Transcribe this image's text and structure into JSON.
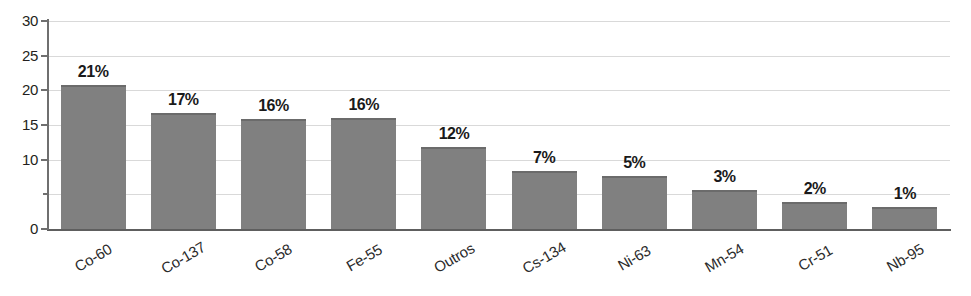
{
  "chart_data": {
    "type": "bar",
    "title": "",
    "subtitle": "",
    "xlabel": "",
    "ylabel": "",
    "categories": [
      "Co-60",
      "Co-137",
      "Co-58",
      "Fe-55",
      "Outros",
      "Cs-134",
      "Ni-63",
      "Mn-54",
      "Cr-51",
      "Nb-95"
    ],
    "values": [
      20.7,
      16.8,
      15.9,
      16.0,
      11.9,
      8.4,
      7.6,
      5.6,
      3.9,
      3.2
    ],
    "data_labels": [
      "21%",
      "17%",
      "16%",
      "16%",
      "12%",
      "7%",
      "5%",
      "3%",
      "2%",
      "1%"
    ],
    "ylim": [
      0,
      30
    ],
    "yticks": [
      0,
      5,
      10,
      15,
      20,
      25,
      30
    ],
    "ytick_labels": [
      "0",
      "",
      "10",
      "15",
      "20",
      "25",
      "30"
    ],
    "grid": true,
    "grid_axis": "y",
    "legend": false,
    "legend_position": "none",
    "bar_color": "#808080",
    "gridline_color": "#d9d9d9",
    "axis_color": "#6f6f6f",
    "label_color": "#1a1a1a",
    "background_color": "#ffffff",
    "category_label_rotation": -30
  }
}
